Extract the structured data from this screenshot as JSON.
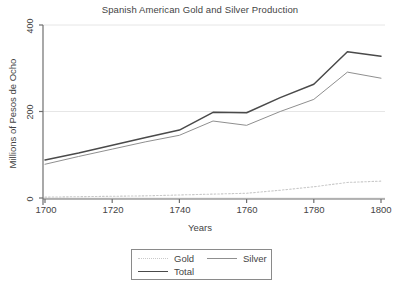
{
  "chart_data": {
    "type": "line",
    "title": "Spanish American Gold and Silver Production",
    "xlabel": "Years",
    "ylabel": "Millions of Pesos de Ocho",
    "xlim": [
      1695,
      1805
    ],
    "ylim": [
      -20,
      410
    ],
    "xticks": [
      1700,
      1720,
      1740,
      1760,
      1780,
      1800
    ],
    "yticks": [
      0,
      200,
      400
    ],
    "grid": "horizontal",
    "legend_position": "bottom-center",
    "x": [
      1700,
      1710,
      1720,
      1730,
      1740,
      1750,
      1760,
      1770,
      1780,
      1790,
      1800
    ],
    "series": [
      {
        "name": "Gold",
        "style": "dotted",
        "color": "#c9c9c9",
        "values": [
          2,
          3,
          4,
          5,
          7,
          9,
          11,
          18,
          26,
          36,
          39
        ]
      },
      {
        "name": "Silver",
        "style": "solid-thin",
        "color": "#8f8f8f",
        "values": [
          78,
          96,
          113,
          130,
          145,
          178,
          168,
          200,
          228,
          291,
          277
        ]
      },
      {
        "name": "Total",
        "style": "solid-thick",
        "color": "#4a4a4a",
        "values": [
          88,
          104,
          122,
          140,
          157,
          198,
          197,
          232,
          263,
          338,
          328
        ]
      }
    ]
  },
  "axis": {
    "ytick_labels": [
      "0",
      "200",
      "400"
    ],
    "xtick_labels": [
      "1700",
      "1720",
      "1740",
      "1760",
      "1780",
      "1800"
    ]
  },
  "legend": {
    "items": [
      {
        "label": "Gold"
      },
      {
        "label": "Silver"
      },
      {
        "label": "Total"
      }
    ]
  }
}
